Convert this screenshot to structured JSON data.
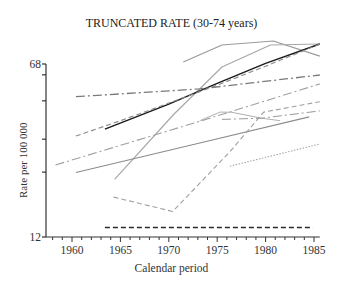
{
  "chart_data": {
    "type": "line",
    "title": "TRUNCATED RATE (30-74 years)",
    "xlabel": "Calendar period",
    "ylabel": "Rate per 100 000",
    "yscale": "log",
    "ylim": [
      12,
      68
    ],
    "y_tick_labels": [
      "12",
      "68"
    ],
    "y_minor_ticks": [
      61,
      47,
      32,
      23
    ],
    "xlim": [
      1957,
      1986
    ],
    "x_tick_labels": [
      "1960",
      "1965",
      "1970",
      "1975",
      "1980",
      "1985"
    ],
    "x_ticks": [
      1960,
      1965,
      1970,
      1975,
      1980,
      1985
    ],
    "grid": false,
    "legend": null,
    "series": [
      {
        "name": "series-1",
        "style": "solid",
        "color": "#9a9a9a",
        "width": 1.2,
        "x": [
          1971.5,
          1975.5,
          1980.8,
          1985.6
        ],
        "y": [
          69.4,
          82.3,
          85.6,
          73.6
        ]
      },
      {
        "name": "series-2",
        "style": "solid",
        "color": "#a8a8a8",
        "width": 1.2,
        "x": [
          1964.4,
          1970.5,
          1975.5,
          1980.5,
          1985.6
        ],
        "y": [
          21.4,
          41.0,
          66.0,
          82.3,
          83.1
        ]
      },
      {
        "name": "series-3",
        "style": "solid",
        "color": "#1a1a1a",
        "width": 1.4,
        "x": [
          1963.4,
          1970,
          1975,
          1980,
          1985.6
        ],
        "y": [
          35.4,
          45.5,
          56.0,
          68.5,
          83.1
        ]
      },
      {
        "name": "series-4",
        "style": "dashed",
        "color": "#8a8a8a",
        "width": 1.1,
        "x": [
          1960.4,
          1965,
          1970,
          1975,
          1980,
          1985.6
        ],
        "y": [
          33.0,
          38.5,
          46.0,
          55.0,
          66.5,
          83.1
        ]
      },
      {
        "name": "series-5",
        "style": "dashdot",
        "color": "#7a7a7a",
        "width": 1.3,
        "x": [
          1960.4,
          1973.2,
          1985.6
        ],
        "y": [
          49.0,
          53.0,
          60.9
        ]
      },
      {
        "name": "series-6",
        "style": "dashdot",
        "color": "#a0a0a0",
        "width": 1.1,
        "x": [
          1958.3,
          1973.2,
          1985.6
        ],
        "y": [
          24.7,
          38.3,
          55.7
        ]
      },
      {
        "name": "series-7",
        "style": "solid",
        "color": "#8c8c8c",
        "width": 1.2,
        "x": [
          1960.4,
          1973.2,
          1984.5
        ],
        "y": [
          22.9,
          30.8,
          40.0
        ]
      },
      {
        "name": "series-8",
        "style": "solid",
        "color": "#b0b0b0",
        "width": 1.0,
        "x": [
          1973.2,
          1975.3,
          1976.5,
          1979.6,
          1981.5
        ],
        "y": [
          38.5,
          42.0,
          41.9,
          39.5,
          38.5
        ]
      },
      {
        "name": "series-9",
        "style": "dashdot",
        "color": "#9a9a9a",
        "width": 1.0,
        "x": [
          1975.5,
          1979.6,
          1985.6
        ],
        "y": [
          39.0,
          39.5,
          42.5
        ]
      },
      {
        "name": "series-10",
        "style": "dashed",
        "color": "#a0a0a0",
        "width": 1.1,
        "x": [
          1964.3,
          1970.4,
          1976.3,
          1979.8,
          1985.6
        ],
        "y": [
          17.9,
          15.5,
          28.2,
          42.0,
          46.6
        ]
      },
      {
        "name": "series-11",
        "style": "dotted",
        "color": "#a8a8a8",
        "width": 1.1,
        "x": [
          1976.3,
          1985.6
        ],
        "y": [
          24.4,
          30.5
        ]
      },
      {
        "name": "series-12",
        "style": "dashed",
        "color": "#2a2a2a",
        "width": 1.3,
        "x": [
          1963.4,
          1984.9
        ],
        "y": [
          13.2,
          13.2
        ]
      }
    ]
  }
}
